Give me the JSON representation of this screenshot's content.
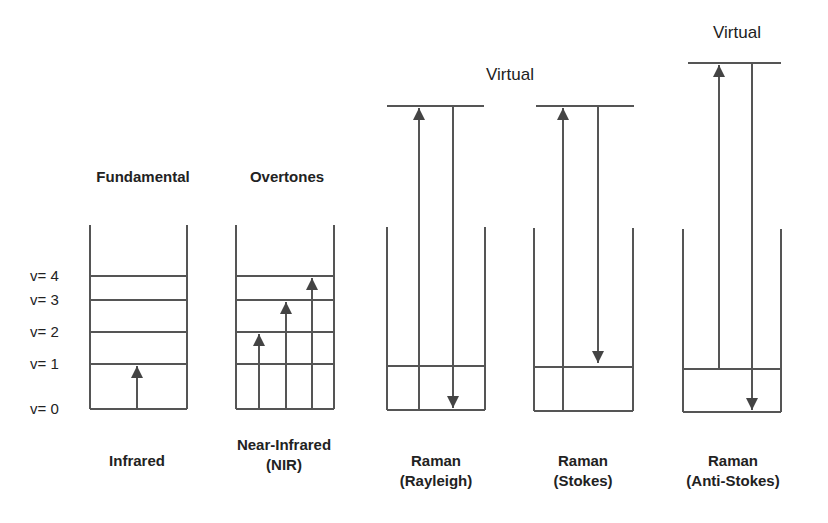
{
  "diagram": {
    "colors": {
      "line": "#555555",
      "arrow": "#444444",
      "text": "#222222",
      "background": "#ffffff"
    },
    "level_labels": [
      {
        "text": "v= 4",
        "y": 276
      },
      {
        "text": "v= 3",
        "y": 300
      },
      {
        "text": "v= 2",
        "y": 332
      },
      {
        "text": "v= 1",
        "y": 364
      },
      {
        "text": "v= 0",
        "y": 409
      }
    ],
    "top_labels": [
      {
        "text": "Fundamental",
        "x": 143,
        "y": 182,
        "style": "bold"
      },
      {
        "text": "Overtones",
        "x": 287,
        "y": 182,
        "style": "bold"
      },
      {
        "text": "Virtual",
        "x": 510,
        "y": 80,
        "style": "reg"
      },
      {
        "text": "Virtual",
        "x": 737,
        "y": 38,
        "style": "reg"
      }
    ],
    "bottom_labels": [
      {
        "lines": [
          "Infrared"
        ],
        "x": 137,
        "y": 466
      },
      {
        "lines": [
          "Near-Infrared",
          "(NIR)"
        ],
        "x": 284,
        "y": 450
      },
      {
        "lines": [
          "Raman",
          "(Rayleigh)"
        ],
        "x": 436,
        "y": 466
      },
      {
        "lines": [
          "Raman",
          "(Stokes)"
        ],
        "x": 583,
        "y": 466
      },
      {
        "lines": [
          "Raman",
          "(Anti-Stokes)"
        ],
        "x": 733,
        "y": 466
      }
    ],
    "panels": [
      {
        "name": "fundamental-infrared",
        "left": 90,
        "right": 187,
        "wall_top": 225,
        "bottom": 409,
        "levels": [
          276,
          300,
          332,
          364,
          409
        ],
        "virtual": null,
        "arrows": [
          {
            "x": 137,
            "from": 409,
            "to": 366,
            "dir": "up"
          }
        ]
      },
      {
        "name": "overtones-nir",
        "left": 236,
        "right": 334,
        "wall_top": 225,
        "bottom": 409,
        "levels": [
          276,
          300,
          332,
          364,
          409
        ],
        "virtual": null,
        "arrows": [
          {
            "x": 259,
            "from": 409,
            "to": 334,
            "dir": "up"
          },
          {
            "x": 286,
            "from": 409,
            "to": 302,
            "dir": "up"
          },
          {
            "x": 312,
            "from": 409,
            "to": 278,
            "dir": "up"
          }
        ]
      },
      {
        "name": "raman-rayleigh",
        "left": 387,
        "right": 485,
        "wall_top": 227,
        "bottom": 410,
        "levels": [
          366,
          410
        ],
        "virtual": {
          "y": 106,
          "x1": 387,
          "x2": 484
        },
        "arrows": [
          {
            "x": 419,
            "from": 410,
            "to": 108,
            "dir": "up"
          },
          {
            "x": 453,
            "from": 106,
            "to": 408,
            "dir": "down"
          }
        ]
      },
      {
        "name": "raman-stokes",
        "left": 534,
        "right": 633,
        "wall_top": 228,
        "bottom": 411,
        "levels": [
          367,
          411
        ],
        "virtual": {
          "y": 106,
          "x1": 536,
          "x2": 634
        },
        "arrows": [
          {
            "x": 563,
            "from": 411,
            "to": 108,
            "dir": "up"
          },
          {
            "x": 598,
            "from": 106,
            "to": 363,
            "dir": "down"
          }
        ]
      },
      {
        "name": "raman-anti-stokes",
        "left": 683,
        "right": 781,
        "wall_top": 229,
        "bottom": 412,
        "levels": [
          369,
          412
        ],
        "virtual": {
          "y": 63,
          "x1": 688,
          "x2": 781
        },
        "arrows": [
          {
            "x": 719,
            "from": 369,
            "to": 65,
            "dir": "up"
          },
          {
            "x": 752,
            "from": 63,
            "to": 410,
            "dir": "down"
          }
        ]
      }
    ]
  }
}
